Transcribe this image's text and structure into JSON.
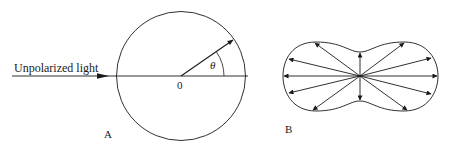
{
  "figure_a": {
    "label": "A",
    "incoming_label": "Unpolarized light",
    "origin_label": "0",
    "angle_label": "θ"
  },
  "figure_b": {
    "label": "B",
    "arrow_count": 12
  },
  "colors": {
    "stroke": "#1a1a1a",
    "background": "#ffffff"
  }
}
